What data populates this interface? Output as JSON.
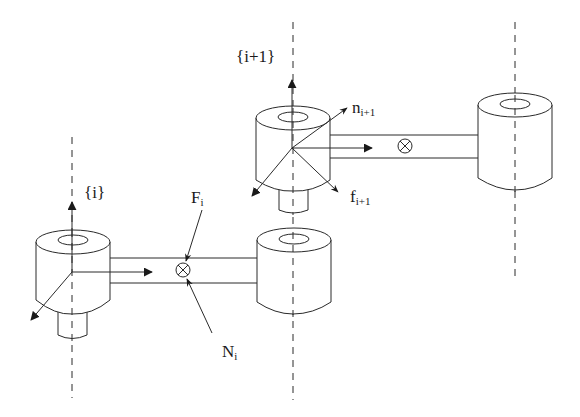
{
  "diagram": {
    "type": "robot-link-force-diagram",
    "colors": {
      "stroke": "#2a2a2a",
      "background": "#ffffff"
    },
    "frames": [
      {
        "id": "frame-i",
        "label": "{i}"
      },
      {
        "id": "frame-i-plus-1",
        "label": "{i+1}"
      }
    ],
    "labels": {
      "frame_i": "{i}",
      "frame_i1": "{i+1}",
      "F_base": "F",
      "F_sub": "i",
      "N_base": "N",
      "N_sub": "i",
      "n_base": "n",
      "n_sub": "i+1",
      "f_base": "f",
      "f_sub": "i+1"
    },
    "symbols": {
      "center_of_mass": "⊗"
    },
    "elements": [
      "joint i cylinder with coordinate frame {i}",
      "link i with center of mass marker, force F_i and moment N_i",
      "joint i+1 cylinder with coordinate frame {i+1}, applied moment n_{i+1} and force f_{i+1}",
      "link i+1 with center of mass marker",
      "joint i+2 cylinder"
    ]
  }
}
